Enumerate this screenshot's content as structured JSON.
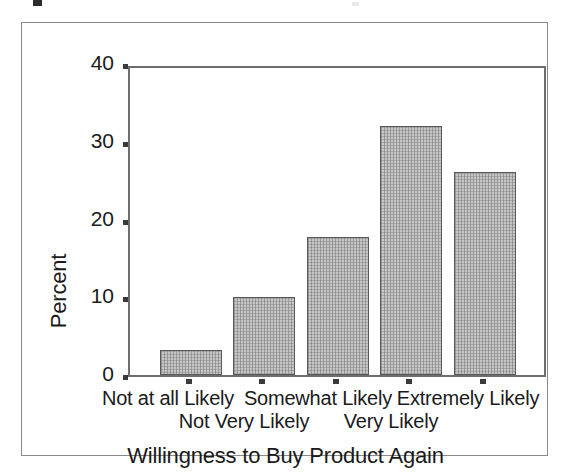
{
  "chart_data": {
    "type": "bar",
    "title": "",
    "subtitle": "",
    "xlabel": "Willingness to Buy Product Again",
    "ylabel": "Percent",
    "categories": [
      "Not at all Likely",
      "Not Very Likely",
      "Somewhat Likely",
      "Very Likely",
      "Extremely Likely"
    ],
    "values": [
      3.2,
      10.2,
      18.0,
      32.4,
      26.4
    ],
    "ylim": [
      0,
      40
    ],
    "yticks": [
      0,
      10,
      20,
      30,
      40
    ],
    "ytick_labels": [
      "0",
      "10",
      "20",
      "30",
      "40"
    ],
    "grid": false,
    "legend": null,
    "legend_position": "none",
    "series": [
      {
        "name": "Percent",
        "values": [
          3.2,
          10.2,
          18.0,
          32.4,
          26.4
        ]
      }
    ],
    "bar_fill_color": "#c6c6c6",
    "bar_edge_color": "#595959",
    "axis_color": "#6e6e6e",
    "frame_color": "#8a8a8a",
    "text_color": "#1a1a1a",
    "label_stagger": [
      "top",
      "bottom",
      "top",
      "bottom",
      "top"
    ]
  }
}
